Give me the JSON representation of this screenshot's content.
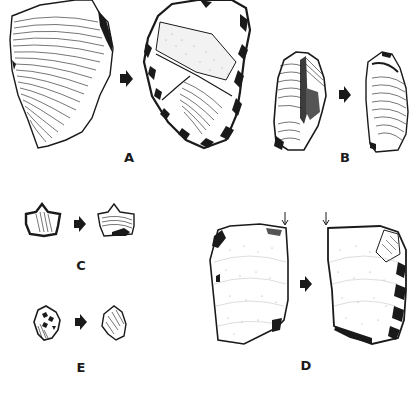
{
  "figure": {
    "type": "archaeological lithic illustration",
    "panels": [
      {
        "id": "A",
        "label": "A",
        "description": "large flake before and after retouch (cortex/ripple-marked blank transformed into heavily retouched tool)"
      },
      {
        "id": "B",
        "label": "B",
        "description": "elongated blade-like piece before and after"
      },
      {
        "id": "C",
        "label": "C",
        "description": "small notched/denticulated piece before and after"
      },
      {
        "id": "D",
        "label": "D",
        "description": "rectangular flake with burin blow (marked by small arrows) before and after"
      },
      {
        "id": "E",
        "label": "E",
        "description": "small retouched fragment before and after"
      }
    ],
    "transition_marker": "filled right-pointing arrow",
    "colors": {
      "ink": "#1a1a1a",
      "paper": "#ffffff",
      "stipple": "#8a8a8a"
    }
  }
}
